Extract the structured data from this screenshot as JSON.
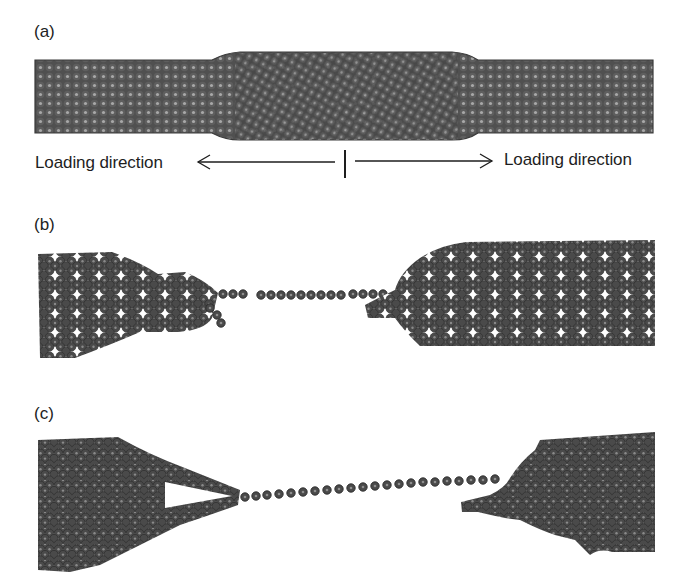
{
  "figure": {
    "panels": [
      {
        "id": "a",
        "label": "(a)",
        "description": "Pristine nanotube/nanowire under tensile load with a wider central region",
        "annotations": {
          "left_label": "Loading direction",
          "right_label": "Loading direction",
          "left_arrow": "arrow-left",
          "right_arrow": "arrow-right",
          "center_marker": "vertical-tick"
        }
      },
      {
        "id": "b",
        "label": "(b)",
        "description": "Necking with formation of a monatomic chain between two fractured ends"
      },
      {
        "id": "c",
        "label": "(c)",
        "description": "Further elongated monatomic chain bridging two fractured ends"
      }
    ],
    "colors": {
      "background": "#ffffff",
      "atom_fill": "#4a4a4a",
      "atom_edge": "#2e2e2e",
      "atom_highlight": "#9a9a9a",
      "text": "#1e1e1e"
    }
  }
}
